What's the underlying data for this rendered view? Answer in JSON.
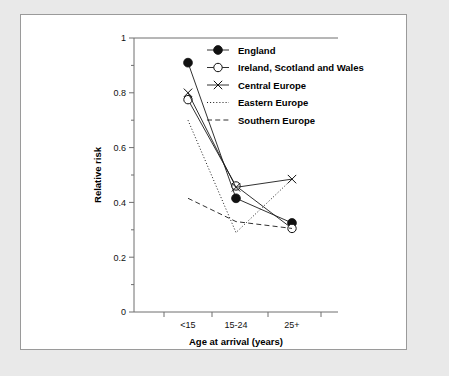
{
  "chart_data": {
    "type": "line",
    "title": "",
    "xlabel": "Age at arrival (years)",
    "ylabel": "Relative risk",
    "categories": [
      "<15",
      "15-24",
      "25+"
    ],
    "ylim": [
      0,
      1
    ],
    "yticks": [
      "0",
      "0.2",
      "0.4",
      "0.6",
      "0.8",
      "1"
    ],
    "ytick_values": [
      0,
      0.2,
      0.4,
      0.6,
      0.8,
      1
    ],
    "yminor_values": [
      0.1,
      0.3,
      0.5,
      0.7,
      0.9
    ],
    "grid": false,
    "legend_position": "top-right",
    "series": [
      {
        "name": "England",
        "marker": "filled-circle",
        "line_style": "solid",
        "values": [
          0.91,
          0.415,
          0.325
        ]
      },
      {
        "name": "Ireland, Scotland and Wales",
        "marker": "open-circle",
        "line_style": "solid",
        "values": [
          0.775,
          0.46,
          0.305
        ]
      },
      {
        "name": "Central Europe",
        "marker": "cross",
        "line_style": "solid",
        "values": [
          0.8,
          0.455,
          0.485
        ]
      },
      {
        "name": "Eastern Europe",
        "marker": "none",
        "line_style": "dotted",
        "values": [
          0.7,
          0.29,
          0.485
        ]
      },
      {
        "name": "Southern Europe",
        "marker": "none",
        "line_style": "dashed",
        "values": [
          0.415,
          0.33,
          0.305
        ]
      }
    ]
  },
  "legend": {
    "items": [
      {
        "label": "England"
      },
      {
        "label": "Ireland, Scotland and Wales"
      },
      {
        "label": "Central Europe"
      },
      {
        "label": "Eastern Europe"
      },
      {
        "label": "Southern Europe"
      }
    ]
  },
  "colors": {
    "page_background": "#e9e9e9",
    "panel_background": "#ffffff",
    "panel_border": "#9a9a9a",
    "axis": "#6e6e6e",
    "ink": "#111111"
  }
}
